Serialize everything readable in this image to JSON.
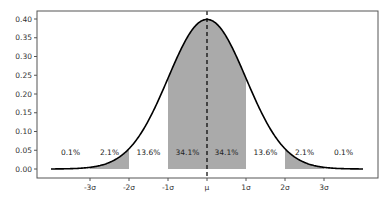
{
  "chart_data": {
    "type": "area",
    "title": "",
    "xlabel": "",
    "ylabel": "",
    "x_range_sigma": [
      -4,
      4
    ],
    "ylim": [
      0.0,
      0.41
    ],
    "grid": false,
    "legend": null,
    "y_ticks": [
      0.0,
      0.05,
      0.1,
      0.15,
      0.2,
      0.25,
      0.3,
      0.35,
      0.4
    ],
    "y_tick_labels": [
      "0.00",
      "0.05",
      "0.10",
      "0.15",
      "0.20",
      "0.25",
      "0.30",
      "0.35",
      "0.40"
    ],
    "x_ticks": [
      -3,
      -2,
      -1,
      0,
      1,
      2,
      3
    ],
    "x_tick_labels": [
      "-3σ",
      "-2σ",
      "-1σ",
      "μ",
      "1σ",
      "2σ",
      "3σ"
    ],
    "mean_line": {
      "x": 0,
      "style": "dashed",
      "color": "#000000"
    },
    "peak_value": 0.3989,
    "shaded_regions": [
      {
        "from": -3,
        "to": -2,
        "color": "#aaaaaa"
      },
      {
        "from": -1,
        "to": 1,
        "color": "#aaaaaa"
      },
      {
        "from": 2,
        "to": 3,
        "color": "#aaaaaa"
      }
    ],
    "region_labels": [
      {
        "x": -3.5,
        "text": "0.1%"
      },
      {
        "x": -2.5,
        "text": "2.1%"
      },
      {
        "x": -1.5,
        "text": "13.6%"
      },
      {
        "x": -0.5,
        "text": "34.1%"
      },
      {
        "x": 0.5,
        "text": "34.1%"
      },
      {
        "x": 1.5,
        "text": "13.6%"
      },
      {
        "x": 2.5,
        "text": "2.1%"
      },
      {
        "x": 3.5,
        "text": "0.1%"
      }
    ],
    "region_label_y": 0.045,
    "colors": {
      "curve": "#000000",
      "fill": "#aaaaaa",
      "frame": "#555555"
    }
  }
}
